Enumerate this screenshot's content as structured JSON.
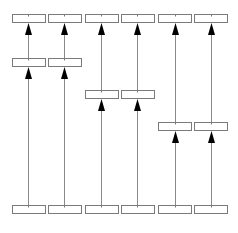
{
  "diagram": {
    "type": "layered-arrow-diagram",
    "colors": {
      "box_stroke": "#7a7a7a",
      "line": "#8a8a8a",
      "arrowhead": "#000000",
      "background": "#ffffff"
    },
    "box_size": {
      "w": 33,
      "h": 8
    },
    "columns": [
      {
        "id": "c1",
        "x": 12,
        "center": 28
      },
      {
        "id": "c2",
        "x": 48,
        "center": 64
      },
      {
        "id": "c3",
        "x": 85,
        "center": 101
      },
      {
        "id": "c4",
        "x": 121,
        "center": 137
      },
      {
        "id": "c5",
        "x": 158,
        "center": 175
      },
      {
        "id": "c6",
        "x": 194,
        "center": 211
      }
    ],
    "boxes": [
      {
        "id": "top-1",
        "col": 0,
        "y": 14,
        "label": ""
      },
      {
        "id": "top-2",
        "col": 1,
        "y": 14,
        "label": ""
      },
      {
        "id": "top-3",
        "col": 2,
        "y": 14,
        "label": ""
      },
      {
        "id": "top-4",
        "col": 3,
        "y": 14,
        "label": ""
      },
      {
        "id": "top-5",
        "col": 4,
        "y": 14,
        "label": ""
      },
      {
        "id": "top-6",
        "col": 5,
        "y": 14,
        "label": ""
      },
      {
        "id": "mid-1",
        "col": 0,
        "y": 58,
        "label": ""
      },
      {
        "id": "mid-2",
        "col": 1,
        "y": 58,
        "label": ""
      },
      {
        "id": "mid-3",
        "col": 2,
        "y": 90,
        "label": ""
      },
      {
        "id": "mid-4",
        "col": 3,
        "y": 90,
        "label": ""
      },
      {
        "id": "mid-5",
        "col": 4,
        "y": 122,
        "label": ""
      },
      {
        "id": "mid-6",
        "col": 5,
        "y": 122,
        "label": ""
      },
      {
        "id": "bot-1",
        "col": 0,
        "y": 205,
        "label": ""
      },
      {
        "id": "bot-2",
        "col": 1,
        "y": 205,
        "label": ""
      },
      {
        "id": "bot-3",
        "col": 2,
        "y": 205,
        "label": ""
      },
      {
        "id": "bot-4",
        "col": 3,
        "y": 205,
        "label": ""
      },
      {
        "id": "bot-5",
        "col": 4,
        "y": 205,
        "label": ""
      },
      {
        "id": "bot-6",
        "col": 5,
        "y": 205,
        "label": ""
      }
    ],
    "arrows": [
      {
        "from": "bot-1",
        "to": "mid-1"
      },
      {
        "from": "mid-1",
        "to": "top-1"
      },
      {
        "from": "bot-2",
        "to": "mid-2"
      },
      {
        "from": "mid-2",
        "to": "top-2"
      },
      {
        "from": "bot-3",
        "to": "mid-3"
      },
      {
        "from": "mid-3",
        "to": "top-3"
      },
      {
        "from": "bot-4",
        "to": "mid-4"
      },
      {
        "from": "mid-4",
        "to": "top-4"
      },
      {
        "from": "bot-5",
        "to": "mid-5"
      },
      {
        "from": "mid-5",
        "to": "top-5"
      },
      {
        "from": "bot-6",
        "to": "mid-6"
      },
      {
        "from": "mid-6",
        "to": "top-6"
      }
    ]
  }
}
